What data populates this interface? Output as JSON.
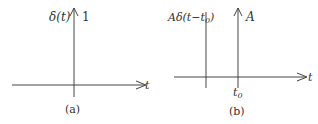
{
  "panels": [
    {
      "id": "a",
      "ylabel": "δ(t)",
      "impulse_label": "1",
      "xlabel": "t",
      "caption": "(a)"
    },
    {
      "id": "b",
      "ylabel": "Aδ(t−t",
      "ylabel_sub": "0",
      "ylabel_close": ")",
      "impulse_label": "A",
      "xlabel": "t",
      "tick_label": "t",
      "tick_sub": "0",
      "caption": "(b)"
    }
  ],
  "colors": {
    "line": "#444444",
    "text": "#333333"
  }
}
